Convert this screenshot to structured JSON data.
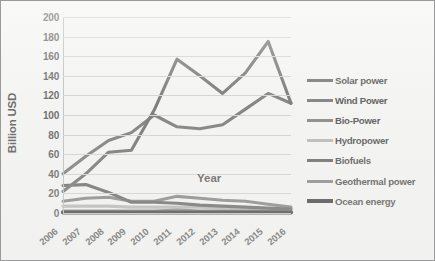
{
  "chart_data": {
    "type": "line",
    "title": "",
    "xlabel": "Year",
    "ylabel": "Billion USD",
    "x": [
      2006,
      2007,
      2008,
      2009,
      2010,
      2011,
      2012,
      2013,
      2014,
      2015,
      2016
    ],
    "categories": [
      "2006",
      "2007",
      "2008",
      "2009",
      "2010",
      "2011",
      "2012",
      "2013",
      "2014",
      "2015",
      "2016"
    ],
    "ylim": [
      0,
      200
    ],
    "yticks": [
      0,
      20,
      40,
      60,
      80,
      100,
      120,
      140,
      160,
      180,
      200
    ],
    "grid": "horizontal",
    "legend_position": "right",
    "series": [
      {
        "name": "Solar power",
        "color": "#555555",
        "values": [
          22,
          40,
          62,
          64,
          105,
          157,
          140,
          122,
          143,
          175,
          112
        ]
      },
      {
        "name": "Wind power",
        "color": "#5f5f5f",
        "values": [
          40,
          58,
          74,
          82,
          100,
          88,
          86,
          90,
          106,
          122,
          112
        ]
      },
      {
        "name": "Bio-Power",
        "color": "#6b6b6b",
        "values": [
          12,
          15,
          16,
          12,
          12,
          17,
          15,
          13,
          12,
          9,
          6
        ]
      },
      {
        "name": "Hydropower",
        "color": "#a9a9a9",
        "values": [
          7,
          7,
          7,
          6,
          6,
          6,
          6,
          5,
          5,
          4,
          4
        ]
      },
      {
        "name": "Biofuels",
        "color": "#4a4a4a",
        "values": [
          28,
          29,
          21,
          11,
          11,
          10,
          8,
          7,
          6,
          5,
          4
        ]
      },
      {
        "name": "Geothermal power",
        "color": "#707070",
        "values": [
          2,
          2,
          2,
          2,
          2,
          3,
          2,
          2,
          2,
          2,
          2
        ]
      },
      {
        "name": "Ocean energy",
        "color": "#1c1c1c",
        "values": [
          0.5,
          0.5,
          0.5,
          0.5,
          0.5,
          0.5,
          0.5,
          0.5,
          0.5,
          0.5,
          0.5
        ]
      }
    ]
  },
  "axis": {
    "y_title": "Billion USD",
    "x_title": "Year",
    "y_ticks": [
      "200",
      "180",
      "160",
      "140",
      "120",
      "100",
      "80",
      "60",
      "40",
      "20",
      "0"
    ],
    "x_ticks": [
      "2006",
      "2007",
      "2008",
      "2009",
      "2010",
      "2011",
      "2012",
      "2013",
      "2014",
      "2015",
      "2016"
    ]
  },
  "legend": {
    "items": [
      {
        "label": "Solar power",
        "color": "#555555"
      },
      {
        "label": "Wind Power",
        "color": "#5f5f5f"
      },
      {
        "label": "Bio-Power",
        "color": "#6b6b6b"
      },
      {
        "label": "Hydropower",
        "color": "#a9a9a9"
      },
      {
        "label": "Biofuels",
        "color": "#4a4a4a"
      },
      {
        "label": "Geothermal power",
        "color": "#707070"
      },
      {
        "label": "Ocean energy",
        "color": "#1c1c1c"
      }
    ]
  },
  "style": {
    "background": "#f2f2f0",
    "border": "#9a9a9a",
    "gridline": "#c9c9c7",
    "tick_text": "#404040"
  }
}
